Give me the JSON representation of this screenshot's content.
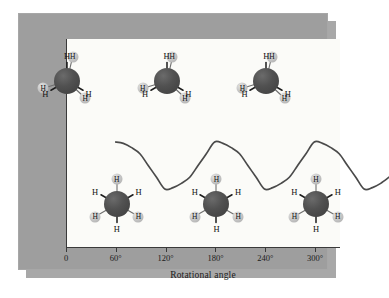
{
  "figure": {
    "title": "",
    "ylabel": "Potential energy",
    "xlabel": "Rotational angle"
  },
  "axis": {
    "xticks": [
      "0",
      "60°",
      "120°",
      "180°",
      "240°",
      "300°"
    ]
  },
  "atoms": {
    "hydrogen": "H"
  },
  "colors": {
    "panel": "#9e9e9e",
    "shadow": "#a8a8a8",
    "plot_background": "#fbfbf8",
    "axis_line": "#3a3a3a",
    "curve": "#4a4a4a",
    "carbon": "#4a4a4a",
    "hydrogen": "#c2c2c2",
    "text": "#1b1b1b"
  },
  "chart_data": {
    "type": "line",
    "title": "",
    "xlabel": "Rotational angle",
    "ylabel": "Potential energy",
    "xlim": [
      0,
      330
    ],
    "ylim": [
      0,
      1
    ],
    "xtick_values": [
      0,
      60,
      120,
      180,
      240,
      300
    ],
    "xtick_labels": [
      "0",
      "60°",
      "120°",
      "180°",
      "240°",
      "300°"
    ],
    "grid": false,
    "legend": null,
    "series": [
      {
        "name": "Potential energy of ethane",
        "comment": "Threefold sinusoidal barrier: maxima (eclipsed) at 0, 120, 240 deg; minima (staggered) at 60, 180, 300 deg",
        "x": [
          0,
          10,
          20,
          30,
          40,
          50,
          60,
          70,
          80,
          90,
          100,
          110,
          120,
          130,
          140,
          150,
          160,
          170,
          180,
          190,
          200,
          210,
          220,
          230,
          240,
          250,
          260,
          270,
          280,
          290,
          300,
          310,
          320,
          330
        ],
        "y": [
          1.0,
          0.97,
          0.88,
          0.75,
          0.5,
          0.25,
          0.0,
          0.03,
          0.12,
          0.25,
          0.5,
          0.75,
          1.0,
          0.97,
          0.88,
          0.75,
          0.5,
          0.25,
          0.0,
          0.03,
          0.12,
          0.25,
          0.5,
          0.75,
          1.0,
          0.97,
          0.88,
          0.75,
          0.5,
          0.25,
          0.0,
          0.03,
          0.12,
          0.25
        ]
      }
    ],
    "annotations": [
      {
        "kind": "molecule",
        "conformation": "eclipsed",
        "angle": 0,
        "position": "above-maximum"
      },
      {
        "kind": "molecule",
        "conformation": "eclipsed",
        "angle": 120,
        "position": "above-maximum"
      },
      {
        "kind": "molecule",
        "conformation": "eclipsed",
        "angle": 240,
        "position": "above-maximum"
      },
      {
        "kind": "molecule",
        "conformation": "staggered",
        "angle": 60,
        "position": "below-minimum"
      },
      {
        "kind": "molecule",
        "conformation": "staggered",
        "angle": 180,
        "position": "below-minimum"
      },
      {
        "kind": "molecule",
        "conformation": "staggered",
        "angle": 300,
        "position": "below-minimum"
      }
    ]
  },
  "molecules": {
    "eclipsed": [
      {
        "id": "eclipsed-0",
        "angle_label": "0°"
      },
      {
        "id": "eclipsed-120",
        "angle_label": "120°"
      },
      {
        "id": "eclipsed-240",
        "angle_label": "240°"
      }
    ],
    "staggered": [
      {
        "id": "staggered-60",
        "angle_label": "60°"
      },
      {
        "id": "staggered-180",
        "angle_label": "180°"
      },
      {
        "id": "staggered-300",
        "angle_label": "300°"
      }
    ]
  }
}
